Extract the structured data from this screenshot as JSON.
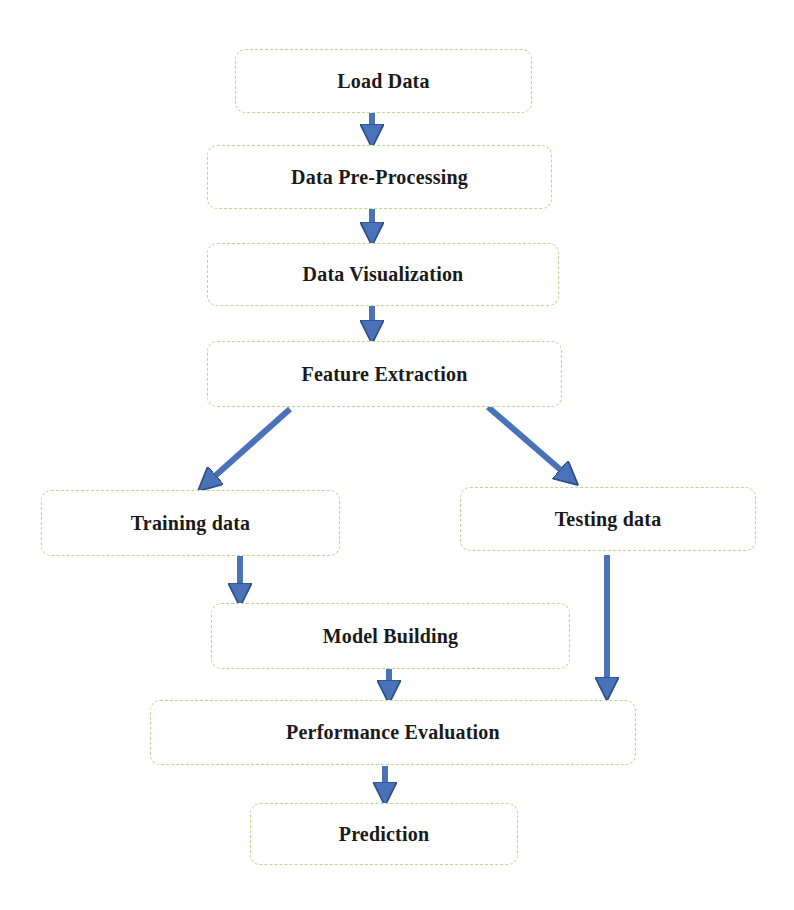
{
  "diagram": {
    "type": "flowchart",
    "colors": {
      "arrow": "#4a72b8",
      "arrow_stroke": "#2f4f8a",
      "box_border": "#b6d98e",
      "text": "#1a1a1a"
    },
    "nodes": [
      {
        "id": "load",
        "label": "Load Data"
      },
      {
        "id": "preprocess",
        "label": "Data Pre-Processing"
      },
      {
        "id": "visualize",
        "label": "Data Visualization"
      },
      {
        "id": "features",
        "label": "Feature Extraction"
      },
      {
        "id": "training",
        "label": "Training data"
      },
      {
        "id": "testing",
        "label": "Testing data"
      },
      {
        "id": "model",
        "label": "Model Building"
      },
      {
        "id": "evaluation",
        "label": "Performance Evaluation"
      },
      {
        "id": "prediction",
        "label": "Prediction"
      }
    ],
    "edges": [
      {
        "from": "Load Data",
        "to": "Data Pre-Processing"
      },
      {
        "from": "Data Pre-Processing",
        "to": "Data Visualization"
      },
      {
        "from": "Data Visualization",
        "to": "Feature Extraction"
      },
      {
        "from": "Feature Extraction",
        "to": "Training data"
      },
      {
        "from": "Feature Extraction",
        "to": "Testing data"
      },
      {
        "from": "Training data",
        "to": "Model Building"
      },
      {
        "from": "Model Building",
        "to": "Performance Evaluation"
      },
      {
        "from": "Testing data",
        "to": "Performance Evaluation"
      },
      {
        "from": "Performance Evaluation",
        "to": "Prediction"
      }
    ]
  }
}
